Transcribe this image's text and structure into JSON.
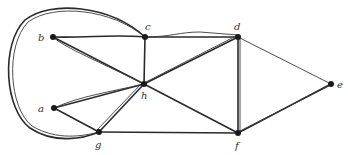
{
  "diagram": {
    "type": "graph",
    "nodes": [
      {
        "id": "a",
        "label": "a",
        "x": 54,
        "y": 108,
        "lx": 38,
        "ly": 112
      },
      {
        "id": "b",
        "label": "b",
        "x": 53,
        "y": 37,
        "lx": 38,
        "ly": 41
      },
      {
        "id": "c",
        "label": "c",
        "x": 145,
        "y": 37,
        "lx": 145,
        "ly": 29
      },
      {
        "id": "d",
        "label": "d",
        "x": 238,
        "y": 37,
        "lx": 235,
        "ly": 29
      },
      {
        "id": "e",
        "label": "e",
        "x": 331,
        "y": 84,
        "lx": 337,
        "ly": 88
      },
      {
        "id": "f",
        "label": "f",
        "x": 238,
        "y": 133,
        "lx": 235,
        "ly": 149
      },
      {
        "id": "g",
        "label": "g",
        "x": 99,
        "y": 132,
        "lx": 95,
        "ly": 148
      },
      {
        "id": "h",
        "label": "h",
        "x": 144,
        "y": 84,
        "lx": 141,
        "ly": 98
      }
    ],
    "edges": [
      {
        "from": "b",
        "to": "c"
      },
      {
        "from": "b",
        "to": "h"
      },
      {
        "from": "c",
        "to": "h"
      },
      {
        "from": "c",
        "to": "d"
      },
      {
        "from": "c",
        "to": "g",
        "curved": true
      },
      {
        "from": "d",
        "to": "h"
      },
      {
        "from": "d",
        "to": "f"
      },
      {
        "from": "d",
        "to": "e"
      },
      {
        "from": "e",
        "to": "f"
      },
      {
        "from": "h",
        "to": "f"
      },
      {
        "from": "h",
        "to": "g"
      },
      {
        "from": "a",
        "to": "h"
      },
      {
        "from": "a",
        "to": "g"
      },
      {
        "from": "g",
        "to": "f"
      }
    ]
  },
  "labels": {
    "a": "a",
    "b": "b",
    "c": "c",
    "d": "d",
    "e": "e",
    "f": "f",
    "g": "g",
    "h": "h"
  }
}
